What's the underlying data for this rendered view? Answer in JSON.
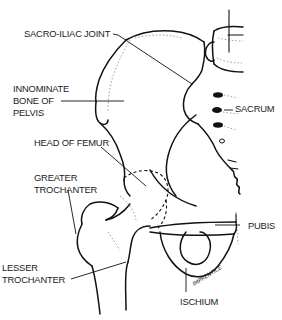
{
  "diagram": {
    "labels": {
      "sacro_iliac_joint": "SACRO-ILIAC JOINT",
      "innominate_line1": "INNOMINATE",
      "innominate_line2": "BONE OF",
      "innominate_line3": "PELVIS",
      "sacrum": "SACRUM",
      "head_of_femur": "HEAD OF FEMUR",
      "greater_trochanter_line1": "GREATER",
      "greater_trochanter_line2": "TROCHANTER",
      "pubis": "PUBIS",
      "lesser_trochanter_line1": "LESSER",
      "lesser_trochanter_line2": "TROCHANTER",
      "ischium": "ISCHIUM"
    },
    "signature": "IMPRENTICE",
    "colors": {
      "ink": "#111111",
      "label_text": "#222222",
      "background": "#ffffff"
    }
  }
}
